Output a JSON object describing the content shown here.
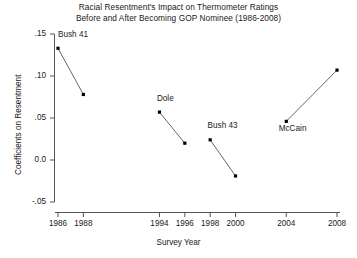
{
  "chart_data": {
    "type": "line",
    "title_lines": [
      "Racial Resentment's Impact on Thermometer Ratings",
      "Before and After Becoming GOP Nominee (1986-2008)"
    ],
    "xlabel": "Survey Year",
    "ylabel": "Coefficients on Resentment",
    "xlim": [
      1985.0,
      2009.0
    ],
    "ylim": [
      -0.05,
      0.15
    ],
    "grid": false,
    "legend": "none",
    "xticks": [
      1986,
      1988,
      1994,
      1996,
      1998,
      2000,
      2004,
      2008
    ],
    "xtick_labels": [
      "1986",
      "1988",
      "1994",
      "1996",
      "1998",
      "2000",
      "2004",
      "2008"
    ],
    "yticks": [
      -0.05,
      0.0,
      0.05,
      0.1,
      0.15
    ],
    "ytick_labels": [
      "-.05",
      "0.0",
      ".05",
      ".10",
      ".15"
    ],
    "marker": "filled-square",
    "marker_color": "#000000",
    "line_color": "#555555",
    "series": [
      {
        "name": "Bush 41",
        "label": "Bush 41",
        "x": [
          1986,
          1988
        ],
        "values": [
          0.133,
          0.078
        ]
      },
      {
        "name": "Dole",
        "label": "Dole",
        "x": [
          1994,
          1996
        ],
        "values": [
          0.057,
          0.02
        ]
      },
      {
        "name": "Bush 43",
        "label": "Bush 43",
        "x": [
          1998,
          2000
        ],
        "values": [
          0.024,
          -0.019
        ]
      },
      {
        "name": "McCain",
        "label": "McCain",
        "x": [
          2004,
          2008
        ],
        "values": [
          0.046,
          0.107
        ]
      }
    ],
    "annotations": [
      {
        "text": "Bush 41",
        "x": 1986.0,
        "y": 0.148,
        "anchor": "start"
      },
      {
        "text": "Dole",
        "x": 1993.8,
        "y": 0.072,
        "anchor": "start"
      },
      {
        "text": "Bush 43",
        "x": 1997.8,
        "y": 0.039,
        "anchor": "start"
      },
      {
        "text": "McCain",
        "x": 2003.4,
        "y": 0.036,
        "anchor": "start"
      }
    ]
  }
}
